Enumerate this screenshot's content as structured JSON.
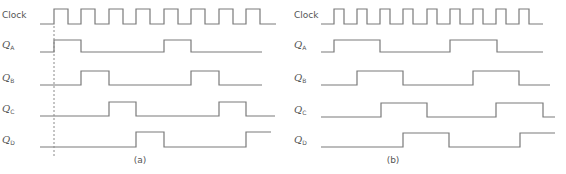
{
  "diagrams": [
    {
      "caption": "(a)",
      "caption_x": 140,
      "label_x": 2,
      "start_x": 40,
      "end_x": 276,
      "clock_rises": [
        54,
        81,
        109,
        136,
        164,
        191,
        219,
        246
      ],
      "clock_half": 14,
      "dashed_line_x": 54,
      "signals": [
        {
          "name": "Clock",
          "sub": "",
          "base_y": 24,
          "high_y": 9,
          "type": "clock"
        },
        {
          "name": "Q",
          "sub": "A",
          "base_y": 52,
          "high_y": 40,
          "edges": [
            [
              54,
              81
            ],
            [
              164,
              191
            ]
          ],
          "end_x": 262
        },
        {
          "name": "Q",
          "sub": "B",
          "base_y": 85,
          "high_y": 71,
          "edges": [
            [
              81,
              109
            ],
            [
              191,
              219
            ]
          ],
          "end_x": 262
        },
        {
          "name": "Q",
          "sub": "C",
          "base_y": 116,
          "high_y": 102,
          "edges": [
            [
              109,
              136
            ],
            [
              219,
              246
            ]
          ],
          "end_x": 275
        },
        {
          "name": "Q",
          "sub": "D",
          "base_y": 147,
          "high_y": 132,
          "edges": [
            [
              136,
              164
            ],
            [
              246,
              271
            ]
          ],
          "end_x": 271
        }
      ]
    },
    {
      "caption": "(b)",
      "caption_x": 393,
      "label_x": 294,
      "start_x": 321,
      "end_x": 543,
      "clock_rises": [
        334,
        357,
        380,
        403,
        427,
        450,
        473,
        496,
        519
      ],
      "clock_half": 10,
      "signals": [
        {
          "name": "Clock",
          "sub": "",
          "base_y": 24,
          "high_y": 9,
          "type": "clock"
        },
        {
          "name": "Q",
          "sub": "A",
          "base_y": 52,
          "high_y": 40,
          "edges": [
            [
              334,
              380
            ],
            [
              450,
              497
            ]
          ],
          "end_x": 543
        },
        {
          "name": "Q",
          "sub": "B",
          "base_y": 85,
          "high_y": 71,
          "edges": [
            [
              357,
              403
            ],
            [
              473,
              519
            ]
          ],
          "end_x": 550
        },
        {
          "name": "Q",
          "sub": "C",
          "base_y": 117,
          "high_y": 103,
          "edges": [
            [
              381,
              427
            ],
            [
              496,
              543
            ]
          ],
          "end_x": 555
        },
        {
          "name": "Q",
          "sub": "D",
          "base_y": 147,
          "high_y": 133,
          "edges": [
            [
              403,
              449
            ],
            [
              520,
              555
            ]
          ],
          "end_x": 555
        }
      ]
    }
  ],
  "colors": {
    "line": "#7a7a7a",
    "text": "#555555",
    "background": "#ffffff"
  }
}
